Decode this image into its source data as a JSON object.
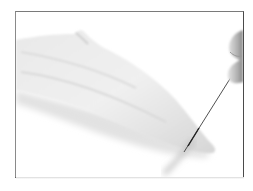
{
  "image": {
    "description": "Photograph of a pale fish fillet being sliced with a thin knife held by a hand, inside a thin dark frame",
    "subjects": [
      "fish-fillet",
      "knife",
      "hand"
    ],
    "colors": {
      "background": "#ffffff",
      "frame": "#4a4a4a",
      "fillet_light": "#efefef",
      "fillet_shadow": "#cfcfcf",
      "knife": "#3c3c3c",
      "skin": "#b8b8b8"
    }
  }
}
